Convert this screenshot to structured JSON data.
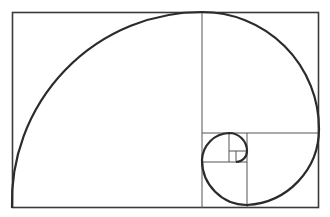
{
  "diagram": {
    "stroke_color": "#2b2b2b",
    "grid_color": "#555555",
    "background": "#ffffff",
    "outer_rect": {
      "x": 12,
      "y": 12,
      "w": 307,
      "h": 196
    },
    "squares": [
      {
        "x": 12,
        "y": 12,
        "size": 190
      },
      {
        "x": 202,
        "y": 12,
        "size": 117
      },
      {
        "x": 247,
        "y": 133,
        "size": 72
      },
      {
        "x": 202,
        "y": 162,
        "size": 45
      },
      {
        "x": 202,
        "y": 133,
        "size": 29
      },
      {
        "x": 229,
        "y": 133,
        "size": 18
      },
      {
        "x": 236,
        "y": 151,
        "size": 11
      }
    ]
  }
}
